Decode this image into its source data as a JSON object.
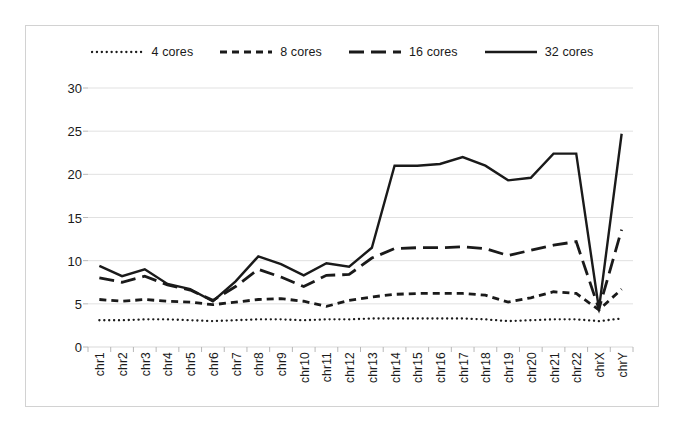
{
  "chart_data": {
    "type": "line",
    "title": "",
    "xlabel": "",
    "ylabel": "",
    "ylim": [
      0,
      30
    ],
    "yticks": [
      0,
      5,
      10,
      15,
      20,
      25,
      30
    ],
    "grid": true,
    "legend_position": "top-center",
    "categories": [
      "chr1",
      "chr2",
      "chr3",
      "chr4",
      "chr5",
      "chr6",
      "chr7",
      "chr8",
      "chr9",
      "chr10",
      "chr11",
      "chr12",
      "chr13",
      "chr14",
      "chr15",
      "chr16",
      "chr17",
      "chr18",
      "chr19",
      "chr20",
      "chr21",
      "chr22",
      "chrX",
      "chrY"
    ],
    "series": [
      {
        "name": "4 cores",
        "style": "dotted",
        "color": "#1a1a1a",
        "values": [
          3.1,
          3.1,
          3.2,
          3.2,
          3.1,
          3.0,
          3.1,
          3.2,
          3.2,
          3.1,
          3.2,
          3.2,
          3.3,
          3.3,
          3.3,
          3.3,
          3.3,
          3.2,
          3.0,
          3.1,
          3.2,
          3.2,
          3.0,
          3.3
        ]
      },
      {
        "name": "8 cores",
        "style": "dashed",
        "color": "#1a1a1a",
        "values": [
          5.5,
          5.3,
          5.5,
          5.3,
          5.2,
          4.9,
          5.2,
          5.5,
          5.6,
          5.3,
          4.7,
          5.4,
          5.8,
          6.1,
          6.2,
          6.2,
          6.2,
          6.0,
          5.2,
          5.7,
          6.4,
          6.2,
          4.3,
          6.7
        ]
      },
      {
        "name": "16 cores",
        "style": "long-dash",
        "color": "#1a1a1a",
        "values": [
          8.0,
          7.5,
          8.2,
          7.2,
          6.6,
          5.4,
          7.0,
          9.0,
          8.1,
          7.0,
          8.3,
          8.4,
          10.3,
          11.4,
          11.5,
          11.5,
          11.6,
          11.4,
          10.6,
          11.2,
          11.8,
          12.2,
          4.4,
          13.6
        ]
      },
      {
        "name": "32 cores",
        "style": "solid",
        "color": "#1a1a1a",
        "values": [
          9.4,
          8.2,
          9.0,
          7.3,
          6.7,
          5.3,
          7.6,
          10.5,
          9.6,
          8.3,
          9.7,
          9.3,
          11.5,
          21.0,
          21.0,
          21.2,
          22.0,
          21.0,
          19.3,
          19.6,
          22.4,
          22.4,
          4.4,
          24.7
        ]
      }
    ]
  },
  "legend": {
    "items": [
      {
        "label": "4 cores",
        "icon": "dotted-line-icon"
      },
      {
        "label": "8 cores",
        "icon": "dashed-line-icon"
      },
      {
        "label": "16 cores",
        "icon": "long-dash-line-icon"
      },
      {
        "label": "32 cores",
        "icon": "solid-line-icon"
      }
    ]
  }
}
